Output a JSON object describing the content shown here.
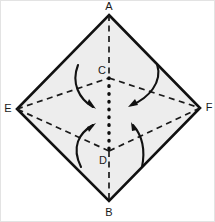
{
  "figure": {
    "type": "geometry-diagram",
    "background_color": "#ffffff",
    "shape_fill_color": "#ededed",
    "outline_color": "#111111",
    "dash_color": "#1a1a1a",
    "arrow_color": "#111111",
    "canvas": {
      "width": 215,
      "height": 222
    }
  },
  "vertices": {
    "A": {
      "label": "A",
      "x": 108,
      "y": 14,
      "label_x": 108,
      "label_y": 9
    },
    "B": {
      "label": "B",
      "x": 108,
      "y": 200,
      "label_x": 108,
      "label_y": 215
    },
    "E": {
      "label": "E",
      "x": 16,
      "y": 108,
      "label_x": 7,
      "label_y": 111
    },
    "F": {
      "label": "F",
      "x": 199,
      "y": 107,
      "label_x": 208,
      "label_y": 110
    },
    "C": {
      "label": "C",
      "x": 108,
      "y": 77,
      "label_x": 101,
      "label_y": 73
    },
    "D": {
      "label": "D",
      "x": 108,
      "y": 150,
      "label_x": 102,
      "label_y": 163
    }
  },
  "outline": {
    "name": "outer-rhombus-AFBE",
    "points": "108,14 199,107 108,200 16,108"
  },
  "dashed_edges": [
    {
      "name": "edge-E-C",
      "x1": 16,
      "y1": 108,
      "x2": 108,
      "y2": 77
    },
    {
      "name": "edge-C-F",
      "x1": 108,
      "y1": 77,
      "x2": 199,
      "y2": 107
    },
    {
      "name": "edge-F-D",
      "x1": 199,
      "y1": 107,
      "x2": 108,
      "y2": 150
    },
    {
      "name": "edge-D-E",
      "x1": 108,
      "y1": 150,
      "x2": 16,
      "y2": 108
    },
    {
      "name": "axis-A-C",
      "x1": 108,
      "y1": 14,
      "x2": 108,
      "y2": 77
    },
    {
      "name": "axis-D-B",
      "x1": 108,
      "y1": 150,
      "x2": 108,
      "y2": 200
    }
  ],
  "dotted_axis": {
    "name": "axis-C-D",
    "x1": 108,
    "y1": 77,
    "x2": 108,
    "y2": 150
  },
  "arrows": [
    {
      "name": "fold-arrow-top-left",
      "direction": "inward-down-right",
      "path": "M 77,64 C 70,82 78,98 92,106",
      "head": "95,108 86,103 88,98"
    },
    {
      "name": "fold-arrow-top-right",
      "direction": "inward-down-left",
      "path": "M 156,63 C 162,82 147,97 131,104",
      "head": "127,106 137,104 134,98"
    },
    {
      "name": "fold-arrow-bottom-left",
      "direction": "inward-up-right",
      "path": "M 80,166 C 70,146 78,132 92,124",
      "head": "95,122 86,126 88,131"
    },
    {
      "name": "fold-arrow-bottom-right",
      "direction": "inward-up-left",
      "path": "M 141,166 C 145,146 139,132 132,124",
      "head": "130,121 131,130 136,129"
    }
  ]
}
